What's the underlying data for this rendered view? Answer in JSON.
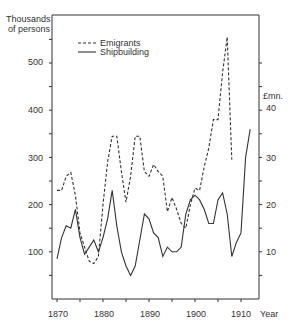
{
  "chart_data": {
    "type": "line",
    "title": "",
    "xlabel": "Year",
    "ylabel_left": "Thousands of persons",
    "ylabel_right": "£mn.",
    "xlim": [
      1870,
      1913
    ],
    "ylim_left": [
      0,
      580
    ],
    "ylim_right": [
      0,
      58
    ],
    "x_ticks": [
      1870,
      1880,
      1890,
      1900,
      1910
    ],
    "y_ticks_left": [
      100,
      200,
      300,
      400,
      500
    ],
    "y_ticks_right": [
      10,
      20,
      30,
      40
    ],
    "grid": false,
    "legend_position": "upper-left-inside",
    "legend": [
      {
        "label": "Emigrants",
        "style": "dashed"
      },
      {
        "label": "Shipbuilding",
        "style": "solid"
      }
    ],
    "series": [
      {
        "name": "Emigrants",
        "axis": "left",
        "unit": "thousands of persons",
        "style": "dashed",
        "x": [
          1870,
          1871,
          1872,
          1873,
          1874,
          1875,
          1876,
          1877,
          1878,
          1879,
          1880,
          1881,
          1882,
          1883,
          1884,
          1885,
          1886,
          1887,
          1888,
          1889,
          1890,
          1891,
          1892,
          1893,
          1894,
          1895,
          1896,
          1897,
          1898,
          1899,
          1900,
          1901,
          1902,
          1903,
          1904,
          1905,
          1906,
          1907,
          1908
        ],
        "values": [
          230,
          230,
          260,
          268,
          220,
          140,
          110,
          80,
          75,
          90,
          200,
          290,
          345,
          345,
          270,
          205,
          260,
          345,
          345,
          270,
          260,
          285,
          270,
          260,
          185,
          215,
          190,
          160,
          150,
          200,
          235,
          230,
          280,
          320,
          380,
          380,
          480,
          555,
          295
        ]
      },
      {
        "name": "Shipbuilding",
        "axis": "right",
        "unit": "£mn",
        "style": "solid",
        "x": [
          1870,
          1871,
          1872,
          1873,
          1874,
          1875,
          1876,
          1877,
          1878,
          1879,
          1880,
          1881,
          1882,
          1883,
          1884,
          1885,
          1886,
          1887,
          1888,
          1889,
          1890,
          1891,
          1892,
          1893,
          1894,
          1895,
          1896,
          1897,
          1898,
          1899,
          1900,
          1901,
          1902,
          1903,
          1904,
          1905,
          1906,
          1907,
          1908,
          1909,
          1910,
          1911,
          1912
        ],
        "values": [
          8.5,
          13,
          15.5,
          15,
          19,
          13,
          9.5,
          11,
          12.5,
          10,
          13,
          17,
          23,
          15.5,
          10,
          7,
          5,
          7,
          12.5,
          18,
          17,
          14,
          13,
          9,
          11,
          10,
          10,
          11,
          18,
          21,
          22,
          21,
          19,
          16,
          16,
          21,
          22.5,
          18,
          9,
          12,
          14,
          30,
          36
        ]
      }
    ]
  },
  "labels": {
    "left_axis_title_1": "Thousands",
    "left_axis_title_2": "of persons",
    "right_axis_title": "£mn.",
    "x_axis_title": "Year",
    "legend_emigrants": "Emigrants",
    "legend_shipbuilding": "Shipbuilding",
    "y_left": [
      "100",
      "200",
      "300",
      "400",
      "500"
    ],
    "y_right": [
      "10",
      "20",
      "30",
      "40"
    ],
    "x": [
      "1870",
      "1880",
      "1890",
      "1900",
      "1910"
    ]
  }
}
